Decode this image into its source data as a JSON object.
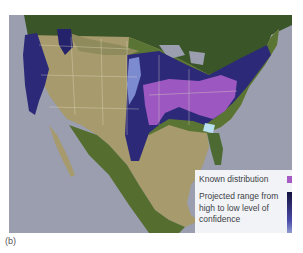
{
  "figure": {
    "panel_label": "(b)"
  },
  "legend": {
    "known_label": "Known distribution",
    "known_color": "#a45cc4",
    "projected_label": "Projected range from high to low level of confidence",
    "gradient_high_color": "#14123e",
    "gradient_mid_color": "#4a4aa8",
    "gradient_low_color": "#c8e4f6"
  },
  "colors": {
    "ocean": "#9a9eae",
    "land_desert": "#b9a57c",
    "land_green": "#4c6a32",
    "land_dark": "#2e4a24",
    "border": "#e6e2c8"
  }
}
